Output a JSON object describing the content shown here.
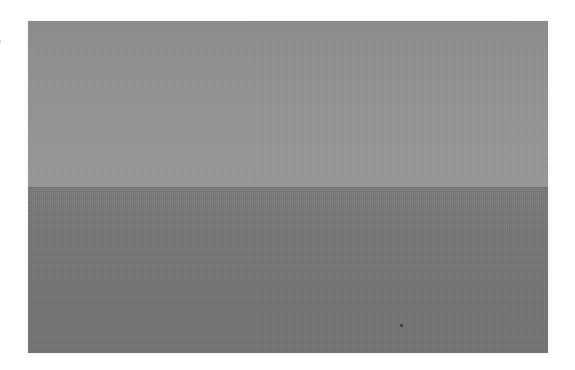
{
  "image": {
    "description": "Minimal gray photograph split into two horizontal tonal bands",
    "regions": [
      {
        "name": "upper-band",
        "tone": "light gray",
        "color": "#939393"
      },
      {
        "name": "lower-band",
        "tone": "darker gray",
        "color": "#767676"
      }
    ],
    "horizon_color": "#6f6f6f",
    "border_color": "#ffffff",
    "text": []
  }
}
